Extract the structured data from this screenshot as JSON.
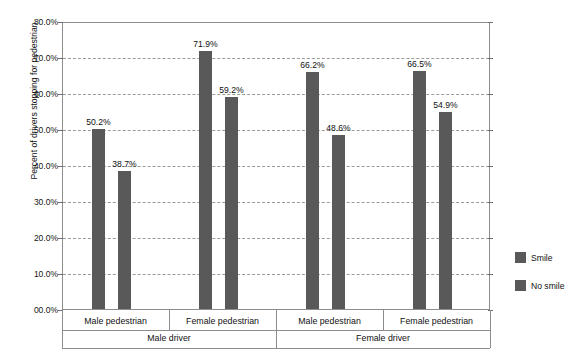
{
  "chart_data": {
    "type": "bar",
    "title": "",
    "xlabel": "",
    "ylabel": "Percent of drivers stopping for pedestrian",
    "ylim": [
      0,
      80
    ],
    "ytick_labels": [
      "80.0%",
      "70.0%",
      "60.0%",
      "50.0%",
      "40.0%",
      "30.0%",
      "20.0%",
      "10.0%",
      "00.0%"
    ],
    "ytick_values": [
      80,
      70,
      60,
      50,
      40,
      30,
      20,
      10,
      0
    ],
    "grid": true,
    "legend_position": "right",
    "categories": [
      "Male pedestrian",
      "Female pedestrian",
      "Male pedestrian",
      "Female pedestrian"
    ],
    "supergroups": [
      {
        "label": "Male driver",
        "span": 2
      },
      {
        "label": "Female driver",
        "span": 2
      }
    ],
    "series": [
      {
        "name": "Smile",
        "color": "#595959",
        "values": [
          50.2,
          71.9,
          66.2,
          66.5
        ]
      },
      {
        "name": "No smile",
        "color": "#595959",
        "values": [
          38.7,
          59.2,
          48.6,
          54.9
        ]
      }
    ],
    "data_labels": [
      [
        "50.2%",
        "38.7%"
      ],
      [
        "71.9%",
        "59.2%"
      ],
      [
        "66.2%",
        "48.6%"
      ],
      [
        "66.5%",
        "54.9%"
      ]
    ]
  },
  "legend": {
    "items": [
      {
        "label": "Smile",
        "color": "#595959"
      },
      {
        "label": "No smile",
        "color": "#595959"
      }
    ]
  },
  "fragments": {
    "top_cut_text": "",
    "bottom_cut_text": ""
  }
}
